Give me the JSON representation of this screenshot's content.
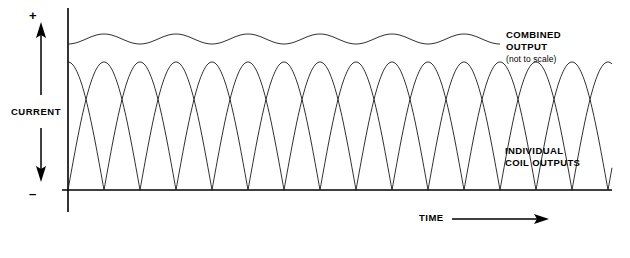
{
  "figure": {
    "background_color": "#ffffff",
    "line_color": "#1a1a1a",
    "axis_color": "#000000"
  },
  "axes": {
    "y_axis_label": "CURRENT",
    "y_positive_symbol": "+",
    "y_negative_symbol": "–",
    "x_axis_label": "TIME",
    "x_axis_arrow": "arrow-right",
    "vertical_axis_x": 68,
    "vertical_axis_top": 8,
    "vertical_axis_bottom": 212,
    "baseline_y": 190,
    "baseline_x_start": 62,
    "baseline_x_end": 612
  },
  "annotations": [
    {
      "name": "combined-output",
      "line1": "COMBINED",
      "line2": "OUTPUT",
      "note": "(not to scale)"
    },
    {
      "name": "individual-coil-outputs",
      "line1": "INDIVIDUAL",
      "line2": "COIL OUTPUTS"
    }
  ],
  "chart_data": {
    "type": "line",
    "xlabel": "TIME",
    "ylabel": "CURRENT",
    "grid": false,
    "legend": "inline-annotations",
    "x_range_px": [
      68,
      612
    ],
    "baseline_px": 190,
    "peak_px": 62,
    "half_period_px": 72,
    "series": [
      {
        "name": "Individual coil output A",
        "type": "rectified-sine",
        "phase_offset_px": 0,
        "amplitude_px": 128,
        "half_period_px": 72,
        "description": "Full-wave rectified sine starting at its peak on the current axis"
      },
      {
        "name": "Individual coil output B",
        "type": "rectified-sine",
        "phase_offset_px": 36,
        "amplitude_px": 128,
        "half_period_px": 72,
        "description": "Full-wave rectified sine offset one half lobe, rising from zero at the current axis"
      },
      {
        "name": "Combined output",
        "type": "ripple",
        "mean_px": 39,
        "ripple_amplitude_px": 5,
        "ripple_period_px": 72,
        "x_end_px": 500,
        "description": "Sum of the individual rectified coil outputs, drawn with small ripple, not to scale"
      }
    ],
    "zero_crossings_px": [
      68,
      141,
      213,
      285,
      357,
      429,
      501,
      573
    ]
  }
}
